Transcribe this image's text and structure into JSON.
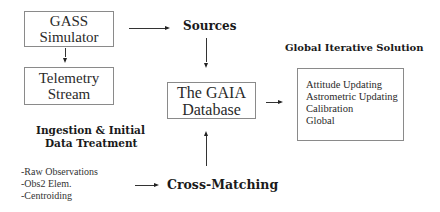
{
  "boxes": {
    "gass_simulator": {
      "lines": [
        "GASS",
        "Simulator"
      ]
    },
    "telemetry_stream": {
      "lines": [
        "Telemetry",
        "Stream"
      ]
    },
    "gaia_database": {
      "lines": [
        "The GAIA",
        "Database"
      ]
    },
    "global_solution": {
      "items": [
        "Attitude Updating",
        "Astrometric Updating",
        "Calibration",
        "Global"
      ]
    }
  },
  "labels": {
    "sources": "Sources",
    "global_iterative_solution": "Global Iterative Solution",
    "ingestion_line1": "Ingestion & Initial",
    "ingestion_line2": "Data Treatment",
    "cross_matching": "Cross-Matching"
  },
  "ingestion_steps": [
    "-Raw Observations",
    "-Obs2 Elem.",
    "-Centroiding"
  ],
  "arrows": [
    {
      "from": "gass_simulator",
      "to": "sources"
    },
    {
      "from": "gass_simulator",
      "to": "telemetry_stream"
    },
    {
      "from": "sources",
      "to": "gaia_database"
    },
    {
      "from": "gaia_database",
      "to": "global_solution"
    },
    {
      "from": "ingestion_steps",
      "to": "cross_matching"
    },
    {
      "from": "cross_matching",
      "to": "gaia_database"
    }
  ]
}
